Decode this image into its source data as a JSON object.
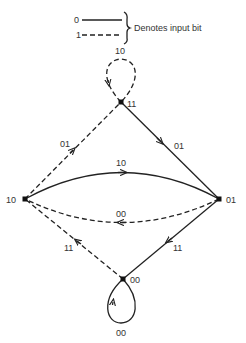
{
  "legend": {
    "solid_bit": "0",
    "dashed_bit": "1",
    "description": "Denotes input bit"
  },
  "nodes": {
    "top": {
      "state": "11"
    },
    "left": {
      "state": "10"
    },
    "right": {
      "state": "01"
    },
    "bottom": {
      "state": "00"
    }
  },
  "edges": {
    "top_self_loop": {
      "from": "11",
      "to": "11",
      "style": "dashed",
      "output": "10"
    },
    "top_to_right": {
      "from": "11",
      "to": "01",
      "style": "solid",
      "output": "01"
    },
    "left_to_top": {
      "from": "10",
      "to": "11",
      "style": "dashed",
      "output": "01"
    },
    "left_to_right": {
      "from": "10",
      "to": "01",
      "style": "solid",
      "output": "10"
    },
    "right_to_left": {
      "from": "01",
      "to": "10",
      "style": "dashed",
      "output": "00"
    },
    "bottom_to_left": {
      "from": "00",
      "to": "10",
      "style": "dashed",
      "output": "11"
    },
    "right_to_bottom": {
      "from": "01",
      "to": "00",
      "style": "solid",
      "output": "11"
    },
    "bottom_self_loop": {
      "from": "00",
      "to": "00",
      "style": "solid",
      "output": "00"
    }
  }
}
